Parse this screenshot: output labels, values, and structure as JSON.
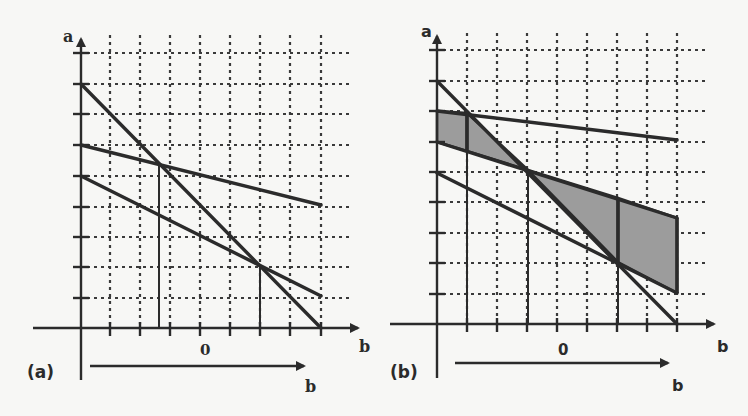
{
  "colors": {
    "background": "#f7f7f5",
    "ink": "#2b2b2b",
    "grid": "#3a3a3a",
    "shade": "#9c9c9c"
  },
  "panels": [
    {
      "id": "a",
      "caption": "(a)",
      "y_axis_label": "a",
      "x_axis_label": "b",
      "origin_label": "0",
      "arrow_label": "b",
      "axes": {
        "y_axis_x": 81,
        "x_axis_y": 328,
        "y_axis_top": 31,
        "y_axis_bottom": 380,
        "x_axis_left": 33,
        "x_axis_right": 366
      },
      "grid_x": [
        110,
        140,
        170,
        200,
        230,
        260,
        290,
        321
      ],
      "grid_y": [
        53,
        84,
        114,
        145,
        176,
        207,
        237,
        267,
        298
      ],
      "grid_extent": {
        "x_right": 350,
        "y_top": 35
      },
      "lines": [
        {
          "name": "steep-line",
          "x1": 81,
          "y1": 84,
          "x2": 321,
          "y2": 328
        },
        {
          "name": "upper-line",
          "x1": 81,
          "y1": 145,
          "x2": 321,
          "y2": 205
        },
        {
          "name": "lower-line",
          "x1": 81,
          "y1": 176,
          "x2": 321,
          "y2": 296
        }
      ],
      "drop_lines": [
        {
          "name": "drop-line-left",
          "x": 159,
          "y1": 165,
          "y2": 328
        },
        {
          "name": "drop-line-right",
          "x": 260,
          "y1": 265,
          "y2": 328
        }
      ],
      "arrow": {
        "x1": 90,
        "x2": 312,
        "y": 366
      },
      "label_pos": {
        "a": [
          63,
          42
        ],
        "b_axis": [
          359,
          352
        ],
        "zero": [
          200,
          355
        ],
        "b_arrow": [
          305,
          392
        ],
        "caption": [
          27,
          378
        ]
      },
      "shaded_regions": []
    },
    {
      "id": "b",
      "caption": "(b)",
      "y_axis_label": "a",
      "x_axis_label": "b",
      "origin_label": "0",
      "arrow_label": "b",
      "axes": {
        "y_axis_x": 437,
        "x_axis_y": 324,
        "y_axis_top": 28,
        "y_axis_bottom": 378,
        "x_axis_left": 390,
        "x_axis_right": 722
      },
      "grid_x": [
        467,
        497,
        527,
        557,
        587,
        617,
        647,
        677
      ],
      "grid_y": [
        50,
        81,
        111,
        142,
        172,
        202,
        233,
        263,
        294
      ],
      "grid_extent": {
        "x_right": 705,
        "y_top": 33
      },
      "lines": [
        {
          "name": "steep-line",
          "x1": 437,
          "y1": 81,
          "x2": 677,
          "y2": 324
        },
        {
          "name": "top-line",
          "x1": 437,
          "y1": 111,
          "x2": 677,
          "y2": 140
        },
        {
          "name": "middle-line",
          "x1": 437,
          "y1": 142,
          "x2": 677,
          "y2": 218
        },
        {
          "name": "lower-line",
          "x1": 437,
          "y1": 173,
          "x2": 677,
          "y2": 293
        }
      ],
      "drop_lines": [
        {
          "name": "drop-line-1",
          "x": 467,
          "y1": 111,
          "y2": 324,
          "thick_to": 151
        },
        {
          "name": "drop-line-2",
          "x": 528,
          "y1": 170,
          "y2": 324,
          "thick_to": 170
        },
        {
          "name": "drop-line-3",
          "x": 618,
          "y1": 198,
          "y2": 324,
          "thick_to": 262
        },
        {
          "name": "right-boundary",
          "x": 677,
          "y1": 218,
          "y2": 293,
          "thick_to": 293
        }
      ],
      "shaded_regions": [
        {
          "name": "shaded-left-box",
          "points": "437,111 467,113 467,151 437,142"
        },
        {
          "name": "shaded-left-triangle",
          "points": "467,113 528,170 467,151"
        },
        {
          "name": "shaded-middle-triangle",
          "points": "528,170 618,198 618,262"
        },
        {
          "name": "shaded-right-quad",
          "points": "618,198 677,218 677,293 618,262"
        }
      ],
      "arrow": {
        "x1": 455,
        "x2": 676,
        "y": 363
      },
      "label_pos": {
        "a": [
          421,
          37
        ],
        "b_axis": [
          717,
          352
        ],
        "zero": [
          558,
          355
        ],
        "b_arrow": [
          672,
          391
        ],
        "caption": [
          390,
          378
        ]
      }
    }
  ]
}
